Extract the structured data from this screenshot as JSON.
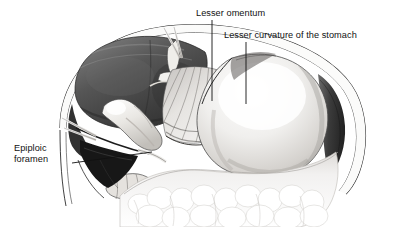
{
  "figure": {
    "kind": "anatomical-illustration",
    "style": "grayscale pen-and-wash medical drawing",
    "background_color": "#ffffff",
    "label_text_color": "#111111",
    "leader_line_color": "#111111"
  },
  "labels": [
    {
      "id": "lesser-omentum",
      "text": "Lesser omentum"
    },
    {
      "id": "lesser-curvature",
      "text": "Lesser curvature of the stomach"
    },
    {
      "id": "epiploic-foramen",
      "line1": "Epiploic",
      "line2": "foramen"
    }
  ],
  "structures": [
    {
      "name": "abdominal-wall",
      "tone": "#ffffff",
      "outline": "#2a2a2a",
      "note": "double-contour cut edge arching across top and right"
    },
    {
      "name": "liver",
      "tone": "#4e4e4e",
      "note": "dark retracted lobe, upper left, lifted by sutures"
    },
    {
      "name": "stomach",
      "tone": "#eceaea",
      "note": "pale rounded body filling right of field"
    },
    {
      "name": "lesser-omentum",
      "tone": "#d8d6d6",
      "note": "fan of radiating striations between liver and lesser curvature"
    },
    {
      "name": "gallbladder",
      "tone": "#e8e6e2",
      "note": "pale elongated sac emerging beneath liver margin"
    },
    {
      "name": "duodenum",
      "tone": "#dedbd7",
      "note": "pale tube below gallbladder at lower left"
    },
    {
      "name": "greater-omentum",
      "tone": "#f4f3f2",
      "note": "lobulated fatty apron fringing the lower border"
    },
    {
      "name": "epiploic-foramen",
      "tone": "#1e1e1e",
      "note": "dark recess behind the free edge at left"
    },
    {
      "name": "retraction-sutures",
      "tone": "#f2f0ec",
      "note": "pale strands at top centre and left margin"
    }
  ],
  "colors": {
    "paper": "#ffffff",
    "ink": "#111111",
    "liver_dark": "#3a3a3a",
    "liver_mid": "#5c5c5c",
    "liver_light": "#8a8a8a",
    "viscera_light": "#efeeec",
    "viscera_shadow": "#b9b6b3",
    "deep_shadow": "#141414"
  }
}
